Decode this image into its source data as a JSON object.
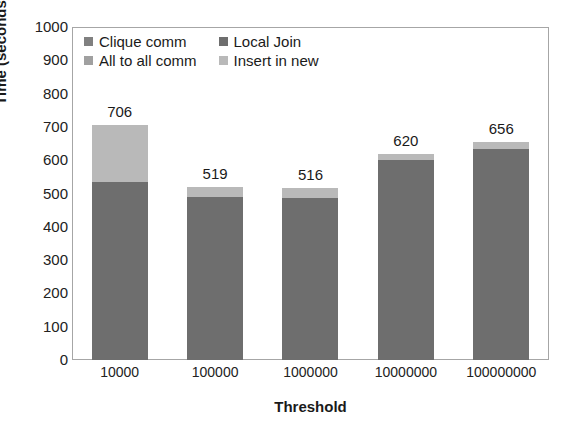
{
  "chart_data": {
    "type": "bar",
    "subtype": "stacked-bar",
    "title": "",
    "xlabel": "Threshold",
    "ylabel": "Time (seconds)",
    "ylim": [
      0,
      1000
    ],
    "ytick_step": 100,
    "yticks": [
      "1000",
      "900",
      "800",
      "700",
      "600",
      "500",
      "400",
      "300",
      "200",
      "100",
      "0"
    ],
    "grid": false,
    "legend_position": "top-left-inside",
    "categories": [
      "10000",
      "100000",
      "1000000",
      "10000000",
      "100000000"
    ],
    "totals": [
      706,
      519,
      516,
      620,
      656
    ],
    "data_labels": [
      "706",
      "519",
      "516",
      "620",
      "656"
    ],
    "series": [
      {
        "name": "Clique comm",
        "color": "#808080",
        "values": [
          0,
          0,
          0,
          0,
          0
        ]
      },
      {
        "name": "Local Join",
        "color": "#6e6e6e",
        "values": [
          535,
          489,
          486,
          602,
          634
        ]
      },
      {
        "name": "All to all comm",
        "color": "#a0a0a0",
        "values": [
          0,
          0,
          0,
          0,
          0
        ]
      },
      {
        "name": "Insert in new",
        "color": "#b9b9b9",
        "values": [
          171,
          30,
          30,
          18,
          22
        ]
      }
    ]
  },
  "legend": {
    "entries": [
      {
        "label": "Clique comm",
        "color": "#808080"
      },
      {
        "label": "Local Join",
        "color": "#6e6e6e"
      },
      {
        "label": "All to all comm",
        "color": "#a0a0a0"
      },
      {
        "label": "Insert in new",
        "color": "#b9b9b9"
      }
    ]
  },
  "axes": {
    "y_title": "Time (seconds)",
    "x_title": "Threshold"
  }
}
